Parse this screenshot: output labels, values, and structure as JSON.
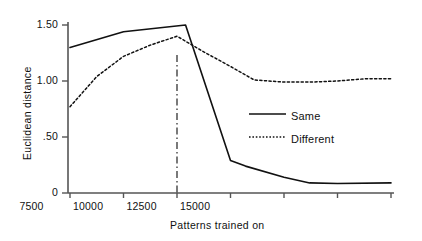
{
  "chart_data": {
    "type": "line",
    "title": "",
    "xlabel": "Patterns trained on",
    "ylabel": "Euclidean distance",
    "xlim": [
      0,
      15000
    ],
    "ylim": [
      0,
      1.6
    ],
    "grid": false,
    "legend_position": "center-right",
    "x_ticks": [
      {
        "value": 0,
        "label": "0"
      },
      {
        "value": 2500,
        "label": "2500"
      },
      {
        "value": 5000,
        "label": "5000"
      },
      {
        "value": 7500,
        "label": "7500"
      },
      {
        "value": 10000,
        "label": "10000"
      },
      {
        "value": 12500,
        "label": "12500"
      },
      {
        "value": 15000,
        "label": "15000"
      }
    ],
    "y_ticks": [
      {
        "value": 0,
        "label": "0"
      },
      {
        "value": 0.5,
        "label": ".50"
      },
      {
        "value": 1.0,
        "label": "1.00"
      },
      {
        "value": 1.5,
        "label": "1.50"
      }
    ],
    "annotations": [
      {
        "type": "vertical-line",
        "style": "dash-dot",
        "x": 5000,
        "label": ""
      }
    ],
    "series": [
      {
        "name": "Same",
        "style": "solid",
        "color": "#111111",
        "points": [
          {
            "x": 0,
            "y": 1.3
          },
          {
            "x": 2500,
            "y": 1.44
          },
          {
            "x": 5400,
            "y": 1.5
          },
          {
            "x": 7500,
            "y": 0.29
          },
          {
            "x": 8200,
            "y": 0.24
          },
          {
            "x": 10000,
            "y": 0.14
          },
          {
            "x": 11200,
            "y": 0.09
          },
          {
            "x": 12500,
            "y": 0.085
          },
          {
            "x": 15000,
            "y": 0.09
          }
        ]
      },
      {
        "name": "Different",
        "style": "dotted",
        "color": "#111111",
        "points": [
          {
            "x": 0,
            "y": 0.77
          },
          {
            "x": 1250,
            "y": 1.04
          },
          {
            "x": 2500,
            "y": 1.22
          },
          {
            "x": 3750,
            "y": 1.32
          },
          {
            "x": 5000,
            "y": 1.4
          },
          {
            "x": 6250,
            "y": 1.26
          },
          {
            "x": 7500,
            "y": 1.13
          },
          {
            "x": 8600,
            "y": 1.01
          },
          {
            "x": 10000,
            "y": 0.99
          },
          {
            "x": 11200,
            "y": 0.99
          },
          {
            "x": 12500,
            "y": 1.0
          },
          {
            "x": 13800,
            "y": 1.02
          },
          {
            "x": 15000,
            "y": 1.02
          }
        ]
      }
    ]
  },
  "legend": {
    "entries": [
      {
        "label": "Same",
        "style": "solid"
      },
      {
        "label": "Different",
        "style": "dotted"
      }
    ]
  }
}
